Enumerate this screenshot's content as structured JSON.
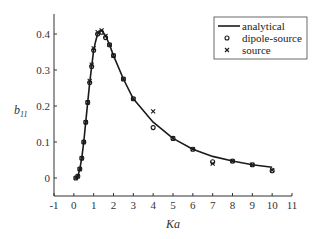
{
  "chart_data": {
    "type": "line",
    "title": "",
    "xlabel": "Ka",
    "ylabel": "b11",
    "ylabel_main": "b",
    "ylabel_sub": "11",
    "xlim": [
      -1,
      11
    ],
    "ylim": [
      -0.05,
      0.45
    ],
    "xticks": [
      -1,
      0,
      1,
      2,
      3,
      4,
      5,
      6,
      7,
      8,
      9,
      10,
      11
    ],
    "yticks": [
      0,
      0.1,
      0.2,
      0.3,
      0.4
    ],
    "grid": false,
    "legend_position": "upper right",
    "series": [
      {
        "name": "analytical",
        "style": "line",
        "x": [
          0.1,
          0.2,
          0.3,
          0.4,
          0.5,
          0.6,
          0.7,
          0.8,
          0.9,
          1.0,
          1.1,
          1.2,
          1.4,
          1.6,
          1.8,
          2.0,
          2.5,
          3.0,
          4.0,
          5.0,
          6.0,
          7.0,
          8.0,
          9.0,
          10.0
        ],
        "values": [
          0.0,
          0.005,
          0.025,
          0.055,
          0.1,
          0.155,
          0.21,
          0.265,
          0.31,
          0.355,
          0.38,
          0.4,
          0.41,
          0.395,
          0.37,
          0.34,
          0.275,
          0.22,
          0.155,
          0.11,
          0.08,
          0.06,
          0.047,
          0.037,
          0.03
        ]
      },
      {
        "name": "dipole-source",
        "style": "circle-marker",
        "x": [
          0.1,
          0.2,
          0.3,
          0.4,
          0.5,
          0.6,
          0.7,
          0.8,
          0.9,
          1.0,
          1.2,
          1.4,
          1.6,
          1.8,
          2.0,
          2.5,
          3.0,
          4.0,
          5.0,
          6.0,
          7.0,
          8.0,
          9.0,
          10.0
        ],
        "values": [
          0.0,
          0.005,
          0.025,
          0.055,
          0.1,
          0.155,
          0.21,
          0.265,
          0.31,
          0.355,
          0.4,
          0.405,
          0.39,
          0.37,
          0.34,
          0.275,
          0.22,
          0.14,
          0.11,
          0.08,
          0.045,
          0.047,
          0.037,
          0.02
        ]
      },
      {
        "name": "source",
        "style": "x-marker",
        "x": [
          0.1,
          0.2,
          0.3,
          0.4,
          0.5,
          0.6,
          0.7,
          0.8,
          0.9,
          1.0,
          1.2,
          1.4,
          1.6,
          1.8,
          2.0,
          2.5,
          3.0,
          4.0,
          5.0,
          6.0,
          7.0,
          8.0,
          9.0,
          10.0
        ],
        "values": [
          0.0,
          0.005,
          0.025,
          0.055,
          0.1,
          0.155,
          0.21,
          0.27,
          0.315,
          0.36,
          0.405,
          0.41,
          0.395,
          0.37,
          0.34,
          0.275,
          0.22,
          0.185,
          0.11,
          0.08,
          0.04,
          0.047,
          0.037,
          0.022
        ]
      }
    ]
  },
  "legend": {
    "items": [
      {
        "label": "analytical",
        "symbol": "line"
      },
      {
        "label": "dipole-source",
        "symbol": "circle"
      },
      {
        "label": "source",
        "symbol": "x"
      }
    ]
  },
  "colors": {
    "axis": "#333333",
    "line": "#1a1a1a",
    "marker": "#1a1a1a"
  }
}
